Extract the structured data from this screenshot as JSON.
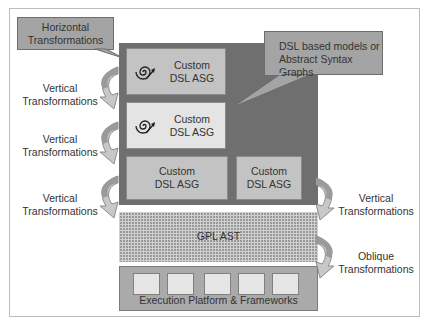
{
  "diagram": {
    "callouts": {
      "horizontal": "Horizontal Transformations",
      "horizontal_l1": "Horizontal",
      "horizontal_l2": "Transformations",
      "dsl_models_l1": "DSL based models or",
      "dsl_models_l2": "Abstract Syntax Graphs"
    },
    "dsl_boxes": [
      {
        "l1": "Custom",
        "l2": "DSL ASG",
        "icon": "spiral-arrow-icon"
      },
      {
        "l1": "Custom",
        "l2": "DSL ASG",
        "icon": "spiral-arrow-icon"
      },
      {
        "l1": "Custom",
        "l2": "DSL ASG"
      },
      {
        "l1": "Custom",
        "l2": "DSL ASG"
      }
    ],
    "gpl": "GPL AST",
    "execution": "Execution Platform & Frameworks",
    "left_labels": [
      {
        "l1": "Vertical",
        "l2": "Transformations"
      },
      {
        "l1": "Vertical",
        "l2": "Transformations"
      },
      {
        "l1": "Vertical",
        "l2": "Transformations"
      }
    ],
    "right_labels": [
      {
        "l1": "Vertical",
        "l2": "Transformations"
      },
      {
        "l1": "Oblique",
        "l2": "Transformations"
      }
    ],
    "colors": {
      "outer": "#6f6f6f",
      "dsl_dark": "#c3c3c3",
      "dsl_light": "#e4e4e4",
      "callout": "#a4a4a4",
      "exec": "#aaaaaa"
    }
  }
}
